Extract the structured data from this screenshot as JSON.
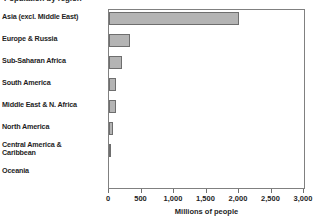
{
  "chart_data": {
    "type": "bar",
    "orientation": "horizontal",
    "title": "Population by region",
    "xlabel": "Millions of people",
    "ylabel": "",
    "categories": [
      "Asia (excl. Middle East)",
      "Europe & Russia",
      "Sub-Saharan Africa",
      "South America",
      "Middle East & N. Africa",
      "North America",
      "Central America &\nCaribbean",
      "Oceania"
    ],
    "values": [
      2000,
      320,
      200,
      105,
      100,
      55,
      30,
      5
    ],
    "xlim": [
      0,
      3000
    ],
    "xticks": [
      0,
      500,
      1000,
      1500,
      2000,
      2500,
      3000
    ],
    "xticklabels": [
      "0",
      "500",
      "1,000",
      "1,500",
      "2,000",
      "2,500",
      "3,000"
    ],
    "grid": false,
    "legend": null,
    "bar_color": "#b4b4b4",
    "bar_edge_color": "#6e6e6e",
    "axis_color": "#808080"
  },
  "axis": {
    "x_title": "Millions of people"
  }
}
